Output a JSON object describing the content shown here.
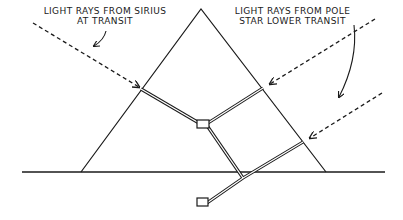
{
  "diagram": {
    "labels": {
      "sirius": {
        "line1": "LIGHT RAYS FROM SIRIUS",
        "line2": "AT TRANSIT"
      },
      "pole_star": {
        "line1": "LIGHT RAYS FROM POLE",
        "line2": "STAR LOWER TRANSIT"
      }
    },
    "colors": {
      "ink": "#1a1a1a",
      "background": "#ffffff"
    }
  }
}
